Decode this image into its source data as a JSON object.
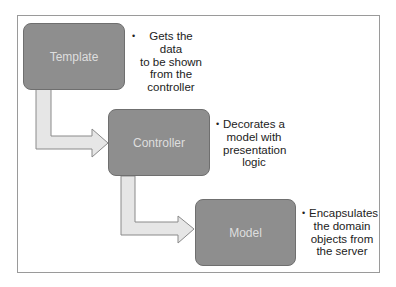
{
  "diagram": {
    "nodes": [
      {
        "id": "template",
        "label": "Template",
        "note_lines": [
          "Gets the data",
          "to be shown",
          "from the",
          "controller"
        ]
      },
      {
        "id": "controller",
        "label": "Controller",
        "note_lines": [
          "Decorates a",
          "model with",
          "presentation",
          "logic"
        ]
      },
      {
        "id": "model",
        "label": "Model",
        "note_lines": [
          "Encapsulates",
          "the domain",
          "objects from",
          "the server"
        ]
      }
    ],
    "edges": [
      {
        "from": "template",
        "to": "controller"
      },
      {
        "from": "controller",
        "to": "model"
      }
    ],
    "bullet": "•",
    "colors": {
      "box_fill": "#8e8e8e",
      "box_border": "#6f6f6f",
      "box_text": "#dedede",
      "arrow_fill": "#e6e6e6",
      "arrow_border": "#8a8a8a",
      "frame_border": "#9a9a9a"
    }
  }
}
